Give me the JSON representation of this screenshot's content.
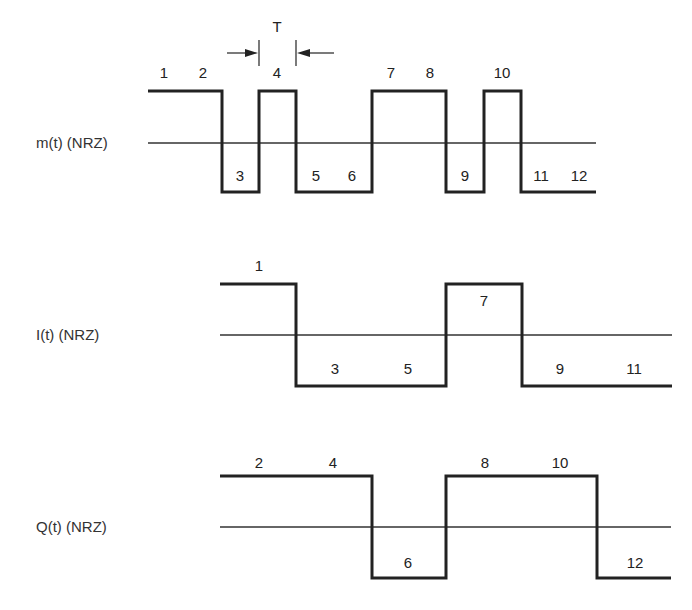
{
  "colors": {
    "line": "#222222",
    "background": "#ffffff"
  },
  "period_marker": {
    "label": "T",
    "x1": 259,
    "x2": 296
  },
  "signals": [
    {
      "id": "m",
      "label": "m(t) (NRZ)",
      "label_y": 148,
      "axis_y": 143,
      "high_y": 91,
      "low_y": 192,
      "axis_x": [
        148,
        596
      ],
      "levels": [
        1,
        1,
        -1,
        1,
        -1,
        -1,
        1,
        1,
        -1,
        1,
        -1,
        -1
      ],
      "edges_x": [
        148,
        185,
        222,
        259,
        296,
        334,
        372,
        409,
        446,
        484,
        521,
        559,
        596
      ],
      "bit_labels": [
        {
          "text": "1",
          "x": 164,
          "y": 78
        },
        {
          "text": "2",
          "x": 203,
          "y": 78
        },
        {
          "text": "3",
          "x": 240,
          "y": 181
        },
        {
          "text": "4",
          "x": 277,
          "y": 78
        },
        {
          "text": "5",
          "x": 316,
          "y": 181
        },
        {
          "text": "6",
          "x": 352,
          "y": 181
        },
        {
          "text": "7",
          "x": 391,
          "y": 78
        },
        {
          "text": "8",
          "x": 430,
          "y": 78
        },
        {
          "text": "9",
          "x": 465,
          "y": 181
        },
        {
          "text": "10",
          "x": 502,
          "y": 78
        },
        {
          "text": "11",
          "x": 541,
          "y": 181
        },
        {
          "text": "12",
          "x": 579,
          "y": 181
        }
      ]
    },
    {
      "id": "I",
      "label": "I(t) (NRZ)",
      "label_y": 340,
      "axis_y": 335,
      "high_y": 284,
      "low_y": 386,
      "axis_x": [
        220,
        672
      ],
      "levels": [
        1,
        -1,
        -1,
        1,
        -1,
        -1
      ],
      "edges_x": [
        220,
        296,
        372,
        446,
        522,
        597,
        672
      ],
      "bit_labels": [
        {
          "text": "1",
          "x": 259,
          "y": 271
        },
        {
          "text": "3",
          "x": 335,
          "y": 374
        },
        {
          "text": "5",
          "x": 408,
          "y": 374
        },
        {
          "text": "7",
          "x": 484,
          "y": 306
        },
        {
          "text": "9",
          "x": 560,
          "y": 374
        },
        {
          "text": "11",
          "x": 634,
          "y": 374
        }
      ]
    },
    {
      "id": "Q",
      "label": "Q(t) (NRZ)",
      "label_y": 532,
      "axis_y": 527,
      "high_y": 476,
      "low_y": 578,
      "axis_x": [
        220,
        671
      ],
      "levels": [
        1,
        1,
        -1,
        1,
        1,
        -1
      ],
      "edges_x": [
        220,
        296,
        372,
        446,
        522,
        597,
        671
      ],
      "bit_labels": [
        {
          "text": "2",
          "x": 259,
          "y": 468
        },
        {
          "text": "4",
          "x": 333,
          "y": 468
        },
        {
          "text": "6",
          "x": 408,
          "y": 568
        },
        {
          "text": "8",
          "x": 485,
          "y": 468
        },
        {
          "text": "10",
          "x": 560,
          "y": 468
        },
        {
          "text": "12",
          "x": 635,
          "y": 568
        }
      ]
    }
  ]
}
